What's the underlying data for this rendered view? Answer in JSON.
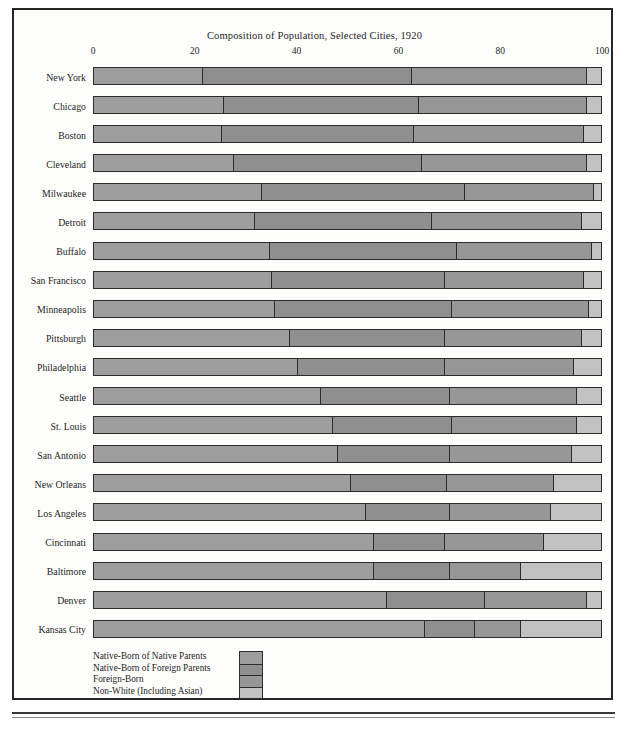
{
  "chart_data": {
    "type": "bar",
    "subtype": "stacked-horizontal-100",
    "title": "Composition of Population, Selected Cities, 1920",
    "xlabel": "",
    "ylabel": "",
    "xlim": [
      0,
      100
    ],
    "xticks": [
      0,
      20,
      40,
      60,
      80,
      100
    ],
    "xtick_labels": [
      "0",
      "20",
      "40",
      "60",
      "80",
      "100"
    ],
    "grid": false,
    "legend_position": "bottom-left",
    "categories": [
      "New York",
      "Chicago",
      "Boston",
      "Cleveland",
      "Milwaukee",
      "Detroit",
      "Buffalo",
      "San Francisco",
      "Minneapolis",
      "Pittsburgh",
      "Philadelphia",
      "Seattle",
      "St. Louis",
      "San Antonio",
      "New Orleans",
      "Los Angeles",
      "Cincinnati",
      "Baltimore",
      "Denver",
      "Kansas City"
    ],
    "series": [
      {
        "name": "Native-Born of Native Parents",
        "color": "#9e9e9e",
        "values": [
          21.4,
          25.5,
          25.0,
          27.5,
          33.0,
          31.5,
          34.5,
          35.0,
          35.5,
          38.5,
          40.0,
          44.5,
          47.0,
          48.0,
          50.5,
          53.5,
          55.0,
          55.0,
          57.5,
          65.0
        ]
      },
      {
        "name": "Native-Born of Foreign Parents",
        "color": "#8f8f8f",
        "values": [
          41.1,
          38.5,
          38.0,
          37.0,
          40.0,
          35.0,
          37.0,
          34.0,
          35.0,
          30.5,
          29.0,
          25.5,
          23.5,
          22.0,
          19.0,
          16.5,
          14.0,
          15.0,
          19.5,
          10.0
        ]
      },
      {
        "name": "Foreign-Born",
        "color": "#979797",
        "values": [
          34.5,
          33.0,
          33.5,
          32.5,
          25.5,
          29.5,
          26.5,
          27.5,
          27.0,
          27.0,
          25.5,
          25.0,
          24.5,
          24.0,
          21.0,
          20.0,
          19.5,
          14.0,
          20.0,
          9.0
        ]
      },
      {
        "name": "Non-White (Including Asian)",
        "color": "#c2c2c2",
        "values": [
          3.0,
          3.0,
          3.5,
          3.0,
          1.5,
          4.0,
          2.0,
          3.5,
          2.5,
          4.0,
          5.5,
          5.0,
          5.0,
          6.0,
          9.5,
          10.0,
          11.5,
          16.0,
          3.0,
          16.0
        ]
      }
    ]
  },
  "legend": {
    "labels": [
      "Native-Born of Native Parents",
      "Native-Born of Foreign Parents",
      "Foreign-Born",
      "Non-White (Including Asian)"
    ]
  }
}
